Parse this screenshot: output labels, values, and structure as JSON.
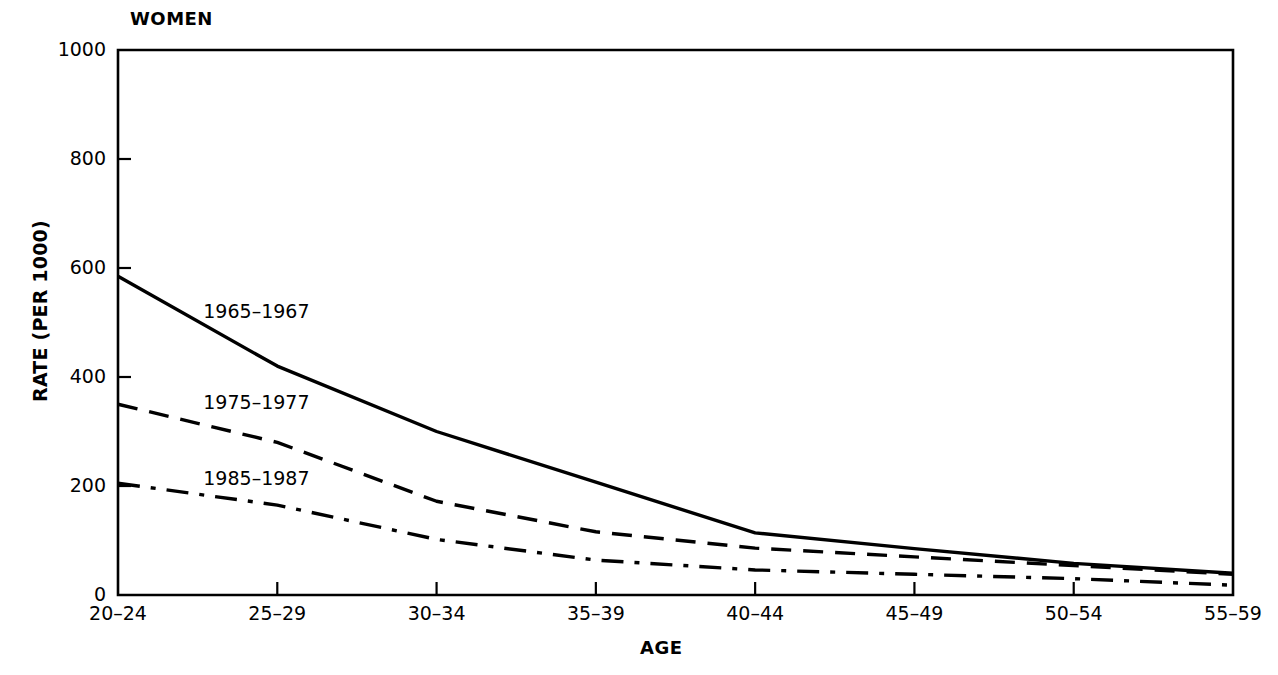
{
  "chart_data": {
    "type": "line",
    "title": "WOMEN",
    "xlabel": "AGE",
    "ylabel": "RATE (PER 1000)",
    "categories": [
      "20–24",
      "25–29",
      "30–34",
      "35–39",
      "40–44",
      "45–49",
      "50–54",
      "55–59"
    ],
    "ylim": [
      0,
      1000
    ],
    "yticks": [
      0,
      200,
      400,
      600,
      800,
      1000
    ],
    "ytick_labels": [
      "0",
      "200",
      "400",
      "600",
      "800",
      "1000"
    ],
    "grid": false,
    "legend_position": "inline-labels",
    "series": [
      {
        "name": "1965–1967",
        "linestyle": "solid",
        "color": "#000000",
        "values": [
          585,
          420,
          300,
          207,
          114,
          85,
          58,
          40
        ],
        "label_x_category": "25–29",
        "label_value": 520
      },
      {
        "name": "1975–1977",
        "linestyle": "dashed",
        "color": "#000000",
        "values": [
          350,
          280,
          172,
          116,
          86,
          70,
          54,
          38
        ],
        "label_x_category": "25–29",
        "label_value": 352
      },
      {
        "name": "1985–1987",
        "linestyle": "dashdot",
        "color": "#000000",
        "values": [
          205,
          165,
          102,
          64,
          46,
          38,
          30,
          18
        ],
        "label_x_category": "25–29",
        "label_value": 212
      }
    ]
  }
}
